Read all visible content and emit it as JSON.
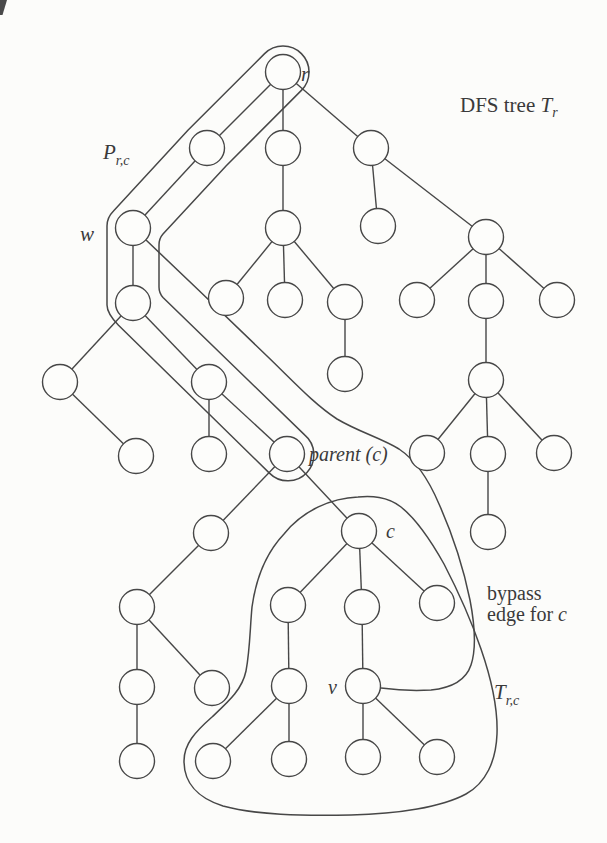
{
  "figure": {
    "background": "#fcfcfa",
    "line_color": "#474747",
    "text_color": "#3a3a3a",
    "node_fill": "#fdfdfb",
    "labels": {
      "root": "r",
      "dfs_title_prefix": "DFS tree ",
      "dfs_title_main": "T",
      "dfs_title_sub": "r",
      "path_main": "P",
      "path_sub": "r,c",
      "w": "w",
      "parent": "parent (c)",
      "c": "c",
      "bypass_line1": "bypass",
      "bypass_line2": "edge for ",
      "bypass_line2_var": "c",
      "v": "v",
      "subtree_main": "T",
      "subtree_sub": "r,c"
    },
    "tree": {
      "node_radius": 17.5,
      "nodes": [
        {
          "id": "r",
          "x": 283,
          "y": 72
        },
        {
          "id": "a",
          "x": 207,
          "y": 148
        },
        {
          "id": "b",
          "x": 283,
          "y": 148
        },
        {
          "id": "cc",
          "x": 371,
          "y": 148
        },
        {
          "id": "w",
          "x": 133,
          "y": 228
        },
        {
          "id": "b1",
          "x": 283,
          "y": 228
        },
        {
          "id": "c1",
          "x": 378,
          "y": 226
        },
        {
          "id": "c2",
          "x": 486,
          "y": 237
        },
        {
          "id": "w1",
          "x": 133,
          "y": 303
        },
        {
          "id": "b1a",
          "x": 226,
          "y": 298
        },
        {
          "id": "b1b",
          "x": 285,
          "y": 300
        },
        {
          "id": "b1c",
          "x": 345,
          "y": 302
        },
        {
          "id": "c2a",
          "x": 417,
          "y": 300
        },
        {
          "id": "c2b",
          "x": 486,
          "y": 301
        },
        {
          "id": "c2c",
          "x": 557,
          "y": 300
        },
        {
          "id": "l1",
          "x": 60,
          "y": 382
        },
        {
          "id": "p3",
          "x": 209,
          "y": 382
        },
        {
          "id": "b1c1",
          "x": 345,
          "y": 374
        },
        {
          "id": "c2b1",
          "x": 486,
          "y": 380
        },
        {
          "id": "l2",
          "x": 136,
          "y": 456
        },
        {
          "id": "p3c",
          "x": 209,
          "y": 454
        },
        {
          "id": "pc",
          "x": 287,
          "y": 454
        },
        {
          "id": "c2b1a",
          "x": 427,
          "y": 453
        },
        {
          "id": "c2b1b",
          "x": 488,
          "y": 454
        },
        {
          "id": "c2b1c",
          "x": 554,
          "y": 453
        },
        {
          "id": "d1",
          "x": 211,
          "y": 533
        },
        {
          "id": "c",
          "x": 359,
          "y": 531
        },
        {
          "id": "c2b1b1",
          "x": 488,
          "y": 532
        },
        {
          "id": "e1",
          "x": 137,
          "y": 607
        },
        {
          "id": "f1",
          "x": 288,
          "y": 605
        },
        {
          "id": "m",
          "x": 362,
          "y": 607
        },
        {
          "id": "rc",
          "x": 437,
          "y": 603
        },
        {
          "id": "e2",
          "x": 137,
          "y": 687
        },
        {
          "id": "e3",
          "x": 212,
          "y": 688
        },
        {
          "id": "f2",
          "x": 289,
          "y": 686
        },
        {
          "id": "v",
          "x": 363,
          "y": 686
        },
        {
          "id": "e4",
          "x": 137,
          "y": 761
        },
        {
          "id": "g1",
          "x": 213,
          "y": 761
        },
        {
          "id": "g2",
          "x": 289,
          "y": 759
        },
        {
          "id": "g3",
          "x": 363,
          "y": 757
        },
        {
          "id": "g4",
          "x": 437,
          "y": 757
        }
      ],
      "edges": [
        [
          "r",
          "a"
        ],
        [
          "r",
          "b"
        ],
        [
          "r",
          "cc"
        ],
        [
          "a",
          "w"
        ],
        [
          "b",
          "b1"
        ],
        [
          "cc",
          "c1"
        ],
        [
          "cc",
          "c2"
        ],
        [
          "w",
          "w1"
        ],
        [
          "b1",
          "b1a"
        ],
        [
          "b1",
          "b1b"
        ],
        [
          "b1",
          "b1c"
        ],
        [
          "c2",
          "c2a"
        ],
        [
          "c2",
          "c2b"
        ],
        [
          "c2",
          "c2c"
        ],
        [
          "w1",
          "l1"
        ],
        [
          "w1",
          "p3"
        ],
        [
          "b1c",
          "b1c1"
        ],
        [
          "c2b",
          "c2b1"
        ],
        [
          "l1",
          "l2"
        ],
        [
          "p3",
          "p3c"
        ],
        [
          "p3",
          "pc"
        ],
        [
          "c2b1",
          "c2b1a"
        ],
        [
          "c2b1",
          "c2b1b"
        ],
        [
          "c2b1",
          "c2b1c"
        ],
        [
          "pc",
          "d1"
        ],
        [
          "pc",
          "c"
        ],
        [
          "c2b1b",
          "c2b1b1"
        ],
        [
          "d1",
          "e1"
        ],
        [
          "c",
          "f1"
        ],
        [
          "c",
          "m"
        ],
        [
          "c",
          "rc"
        ],
        [
          "e1",
          "e2"
        ],
        [
          "e1",
          "e3"
        ],
        [
          "f1",
          "f2"
        ],
        [
          "m",
          "v"
        ],
        [
          "e2",
          "e4"
        ],
        [
          "f2",
          "g1"
        ],
        [
          "f2",
          "g2"
        ],
        [
          "v",
          "g3"
        ],
        [
          "v",
          "g4"
        ]
      ]
    }
  }
}
